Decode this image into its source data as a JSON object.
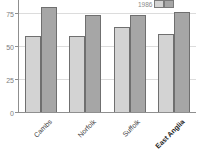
{
  "chart_data": {
    "type": "bar",
    "categories": [
      "Cambs",
      "Norfolk",
      "Suffolk",
      "East Anglia"
    ],
    "series": [
      {
        "name": "1986",
        "color": "#d3d3d3",
        "values": [
          58,
          58,
          65,
          60
        ]
      },
      {
        "name": "",
        "color": "#a6a6a6",
        "values": [
          80,
          74,
          74,
          76
        ]
      }
    ],
    "title": "",
    "xlabel": "",
    "ylabel": "",
    "yticks": [
      0,
      25,
      50,
      75
    ],
    "ylim_visible": [
      0,
      85
    ],
    "grid": "horizontal",
    "legend_position": "top-right",
    "legend_label": "1986",
    "emphasized_category": "East Anglia",
    "colors": {
      "background": "#ffffff",
      "axis": "#8f8f8f",
      "gridline": "#dcdcdc",
      "bar_border": "#6f6f6f",
      "tick_label": "#7d7d7d",
      "category_label": "#3c3c3c"
    }
  }
}
